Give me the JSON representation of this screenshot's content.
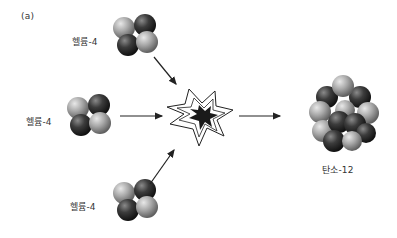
{
  "panel_label": "(a)",
  "reactants": [
    {
      "label": "헬륨-4",
      "nucleons": 4
    },
    {
      "label": "헬륨-4",
      "nucleons": 4
    },
    {
      "label": "헬륨-4",
      "nucleons": 4
    }
  ],
  "product": {
    "label": "탄소-12",
    "nucleons": 12
  },
  "event": "fusion-burst",
  "colors": {
    "proton": "#3a3a3a",
    "neutron": "#a8a8a8",
    "arrow": "#222222",
    "burst_fill": "#1a1a1a",
    "text": "#333333"
  }
}
